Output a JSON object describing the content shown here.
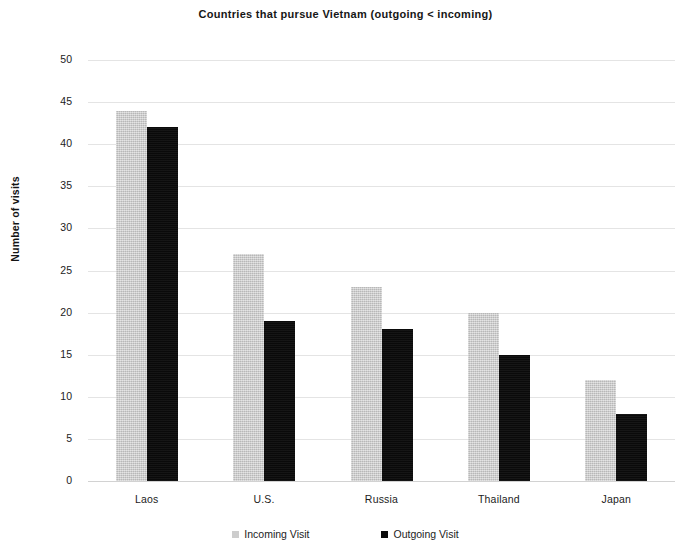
{
  "chart_data": {
    "type": "bar",
    "title": "Countries that pursue Vietnam (outgoing < incoming)",
    "xlabel": "",
    "ylabel": "Number of visits",
    "categories": [
      "Laos",
      "U.S.",
      "Russia",
      "Thailand",
      "Japan"
    ],
    "series": [
      {
        "name": "Incoming Visit",
        "color": "#cdcdcd",
        "values": [
          44,
          27,
          23,
          20,
          12
        ]
      },
      {
        "name": "Outgoing Visit",
        "color": "#0b0b0b",
        "values": [
          42,
          19,
          18,
          15,
          8
        ]
      }
    ],
    "ylim": [
      0,
      50
    ],
    "yticks": [
      0,
      5,
      10,
      15,
      20,
      25,
      30,
      35,
      40,
      45,
      50
    ],
    "ytick_labels": [
      "0",
      "5",
      "10",
      "15",
      "20",
      "25",
      "30",
      "35",
      "40",
      "45",
      "50"
    ],
    "grid": true,
    "grid_axis": "y",
    "legend_position": "bottom",
    "background": "#ffffff"
  },
  "legend": {
    "items": [
      {
        "label": "Incoming Visit",
        "marker": "square-swatch-icon"
      },
      {
        "label": "Outgoing Visit",
        "marker": "square-swatch-icon"
      }
    ]
  }
}
